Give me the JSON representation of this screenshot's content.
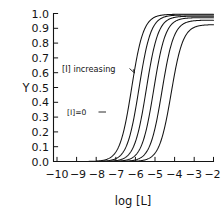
{
  "chart_data": {
    "type": "line",
    "title": "",
    "subtitle": "",
    "xlabel": "log [L]",
    "ylabel": "Y",
    "xlim": [
      -10.6,
      -1.9
    ],
    "ylim": [
      0.0,
      1.0
    ],
    "grid": false,
    "legend_position": "none",
    "x_ticks": [
      -10,
      -9,
      -8,
      -7,
      -6,
      -5,
      -4,
      -3,
      -2
    ],
    "x_tick_labels": [
      "−10",
      "−9",
      "−8",
      "−7",
      "−6",
      "−5",
      "−4",
      "−3",
      "−2"
    ],
    "y_ticks": [
      0.0,
      0.1,
      0.2,
      0.3,
      0.4,
      0.5,
      0.6,
      0.7,
      0.8,
      0.9,
      1.0
    ],
    "y_tick_labels": [
      "0.0",
      "0.1",
      "0.2",
      "0.3",
      "0.4",
      "0.5",
      "0.6",
      "0.7",
      "0.8",
      "0.9",
      "1.0"
    ],
    "x": [
      -10.0,
      -9.5,
      -9.0,
      -8.5,
      -8.0,
      -7.5,
      -7.0,
      -6.5,
      -6.0,
      -5.5,
      -5.0,
      -4.5,
      -4.0,
      -3.5,
      -3.0,
      -2.5,
      -2.0
    ],
    "series": [
      {
        "name": "[I]=0",
        "label": "[I]=0",
        "ec50_log": -6.35,
        "hill": 1.35,
        "top": 0.995,
        "values": [
          0.0,
          0.001,
          0.002,
          0.004,
          0.009,
          0.022,
          0.056,
          0.139,
          0.318,
          0.573,
          0.793,
          0.912,
          0.963,
          0.983,
          0.991,
          0.994,
          0.995
        ]
      },
      {
        "name": "curve-2",
        "label": "",
        "ec50_log": -5.95,
        "hill": 1.35,
        "top": 0.99,
        "values": [
          0.0,
          0.0,
          0.001,
          0.002,
          0.004,
          0.009,
          0.023,
          0.058,
          0.143,
          0.322,
          0.575,
          0.791,
          0.908,
          0.959,
          0.979,
          0.987,
          0.99
        ]
      },
      {
        "name": "curve-3",
        "label": "",
        "ec50_log": -5.55,
        "hill": 1.35,
        "top": 0.982,
        "values": [
          0.0,
          0.0,
          0.0,
          0.001,
          0.002,
          0.004,
          0.009,
          0.024,
          0.059,
          0.145,
          0.322,
          0.571,
          0.784,
          0.899,
          0.95,
          0.971,
          0.979
        ]
      },
      {
        "name": "curve-4",
        "label": "",
        "ec50_log": -5.15,
        "hill": 1.35,
        "top": 0.972,
        "values": [
          0.0,
          0.0,
          0.0,
          0.0,
          0.001,
          0.002,
          0.004,
          0.009,
          0.024,
          0.059,
          0.144,
          0.318,
          0.563,
          0.772,
          0.885,
          0.938,
          0.962
        ]
      },
      {
        "name": "curve-5",
        "label": "",
        "ec50_log": -4.7,
        "hill": 1.35,
        "top": 0.955,
        "values": [
          0.0,
          0.0,
          0.0,
          0.0,
          0.0,
          0.001,
          0.002,
          0.003,
          0.009,
          0.023,
          0.057,
          0.139,
          0.307,
          0.547,
          0.754,
          0.868,
          0.925
        ]
      },
      {
        "name": "curve-6",
        "label": "",
        "ec50_log": -4.2,
        "hill": 1.35,
        "top": 0.925,
        "values": [
          0.0,
          0.0,
          0.0,
          0.0,
          0.0,
          0.0,
          0.001,
          0.001,
          0.003,
          0.008,
          0.021,
          0.052,
          0.127,
          0.285,
          0.513,
          0.72,
          0.845
        ]
      }
    ],
    "annotations": [
      {
        "id": "increasing-annotation",
        "text": "[I] increasing",
        "x": -8.0,
        "y": 0.645,
        "pointer": "down-right"
      },
      {
        "id": "zero-inhibitor-annotation",
        "text": "[I]=0",
        "x": -7.55,
        "y": 0.355,
        "pointer": "right"
      }
    ]
  }
}
